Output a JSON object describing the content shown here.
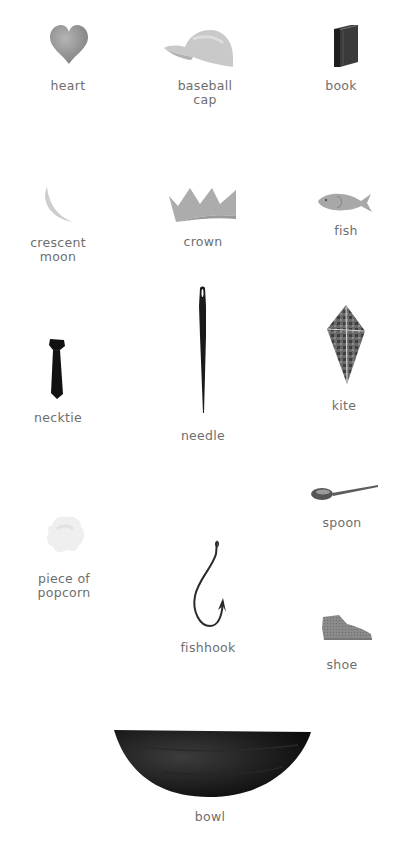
{
  "items": [
    {
      "id": "heart",
      "label": "heart"
    },
    {
      "id": "baseball-cap",
      "label": "baseball\ncap"
    },
    {
      "id": "book",
      "label": "book"
    },
    {
      "id": "crescent-moon",
      "label": "crescent\nmoon"
    },
    {
      "id": "crown",
      "label": "crown"
    },
    {
      "id": "fish",
      "label": "fish"
    },
    {
      "id": "necktie",
      "label": "necktie"
    },
    {
      "id": "needle",
      "label": "needle"
    },
    {
      "id": "kite",
      "label": "kite"
    },
    {
      "id": "piece-of-popcorn",
      "label": "piece of\npopcorn"
    },
    {
      "id": "fishhook",
      "label": "fishhook"
    },
    {
      "id": "spoon",
      "label": "spoon"
    },
    {
      "id": "shoe",
      "label": "shoe"
    },
    {
      "id": "bowl",
      "label": "bowl"
    }
  ]
}
